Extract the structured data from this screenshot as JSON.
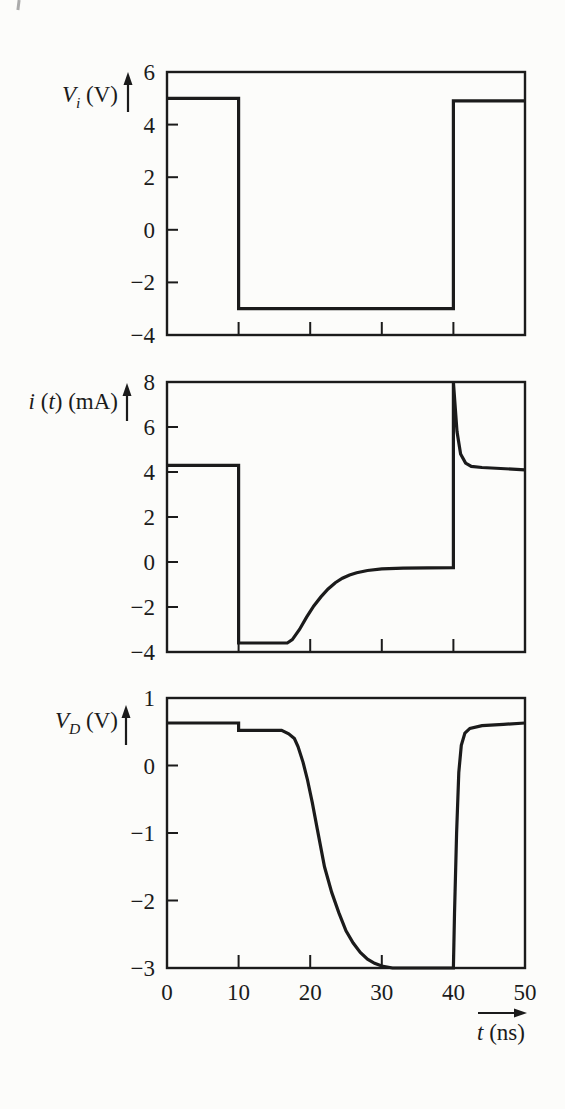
{
  "ink_color": "#1b1b1b",
  "background_color": "#fcfcfa",
  "x_axis": {
    "label": "t (ns)",
    "label_parts": [
      {
        "text": "t",
        "italic": true
      },
      {
        "text": " (ns)",
        "italic": false
      }
    ],
    "ticks": [
      0,
      10,
      20,
      30,
      40,
      50
    ],
    "range_ns": [
      0,
      50
    ]
  },
  "chart_data": [
    {
      "type": "line",
      "name": "input-voltage",
      "title": "",
      "ylabel": "Vi (V)",
      "ylabel_parts": [
        {
          "text": "V",
          "italic": true
        },
        {
          "text": "i",
          "italic": true,
          "sub": true
        },
        {
          "text": " (V)",
          "italic": false
        }
      ],
      "xlim": [
        0,
        50
      ],
      "ylim": [
        -4,
        6
      ],
      "yticks": [
        6,
        4,
        2,
        0,
        -2,
        -4
      ],
      "xticks": [
        10,
        20,
        30,
        40
      ],
      "x_tick_labels": [],
      "grid": false,
      "series": [
        {
          "name": "input-voltage",
          "points": [
            [
              0,
              5
            ],
            [
              10,
              5
            ],
            [
              10,
              -3
            ],
            [
              40,
              -3
            ],
            [
              40,
              4.9
            ],
            [
              50,
              4.9
            ]
          ]
        }
      ]
    },
    {
      "type": "line",
      "name": "diode-current",
      "title": "",
      "ylabel": "i (t) (mA)",
      "ylabel_parts": [
        {
          "text": "i",
          "italic": true
        },
        {
          "text": " (",
          "italic": false
        },
        {
          "text": "t",
          "italic": true
        },
        {
          "text": ") (mA)",
          "italic": false
        }
      ],
      "xlim": [
        0,
        50
      ],
      "ylim": [
        -4,
        8
      ],
      "yticks": [
        8,
        6,
        4,
        2,
        0,
        -2,
        -4
      ],
      "xticks": [
        10,
        20,
        30,
        40
      ],
      "x_tick_labels": [],
      "grid": false,
      "series": [
        {
          "name": "diode-current",
          "points": [
            [
              0,
              4.3
            ],
            [
              10,
              4.3
            ],
            [
              10,
              -3.6
            ],
            [
              16.8,
              -3.6
            ],
            [
              17.5,
              -3.45
            ],
            [
              18.5,
              -3.0
            ],
            [
              19.5,
              -2.45
            ],
            [
              20.5,
              -1.95
            ],
            [
              21.5,
              -1.55
            ],
            [
              22.5,
              -1.2
            ],
            [
              23.5,
              -0.92
            ],
            [
              24.5,
              -0.72
            ],
            [
              25.5,
              -0.58
            ],
            [
              26.5,
              -0.48
            ],
            [
              28,
              -0.38
            ],
            [
              30,
              -0.3
            ],
            [
              33,
              -0.27
            ],
            [
              40,
              -0.25
            ],
            [
              40,
              8
            ],
            [
              40.5,
              5.8
            ],
            [
              41,
              4.8
            ],
            [
              41.7,
              4.4
            ],
            [
              42.5,
              4.25
            ],
            [
              44,
              4.2
            ],
            [
              50,
              4.1
            ]
          ]
        }
      ]
    },
    {
      "type": "line",
      "name": "diode-voltage",
      "title": "",
      "ylabel": "VD (V)",
      "ylabel_parts": [
        {
          "text": "V",
          "italic": true
        },
        {
          "text": "D",
          "italic": true,
          "sub": true
        },
        {
          "text": " (V)",
          "italic": false
        }
      ],
      "xlabel": "t (ns)",
      "xlim": [
        0,
        50
      ],
      "ylim": [
        -3,
        1
      ],
      "yticks": [
        1,
        0,
        -1,
        -2,
        -3
      ],
      "xticks": [
        10,
        20,
        30,
        40
      ],
      "x_tick_labels": [
        0,
        10,
        20,
        30,
        40,
        50
      ],
      "grid": false,
      "series": [
        {
          "name": "diode-voltage",
          "points": [
            [
              0,
              0.63
            ],
            [
              10,
              0.63
            ],
            [
              10,
              0.52
            ],
            [
              16,
              0.52
            ],
            [
              17,
              0.47
            ],
            [
              17.8,
              0.4
            ],
            [
              18.3,
              0.28
            ],
            [
              19,
              0.05
            ],
            [
              19.6,
              -0.2
            ],
            [
              20.3,
              -0.55
            ],
            [
              21,
              -0.95
            ],
            [
              22,
              -1.5
            ],
            [
              23,
              -1.88
            ],
            [
              24,
              -2.18
            ],
            [
              25,
              -2.45
            ],
            [
              26,
              -2.63
            ],
            [
              27,
              -2.77
            ],
            [
              28,
              -2.87
            ],
            [
              29,
              -2.93
            ],
            [
              30,
              -2.97
            ],
            [
              31.5,
              -3
            ],
            [
              40,
              -3
            ],
            [
              40.15,
              -2.2
            ],
            [
              40.45,
              -1.0
            ],
            [
              40.75,
              -0.1
            ],
            [
              41.1,
              0.3
            ],
            [
              41.6,
              0.48
            ],
            [
              42.3,
              0.55
            ],
            [
              44,
              0.59
            ],
            [
              47,
              0.61
            ],
            [
              50,
              0.63
            ]
          ]
        }
      ]
    }
  ]
}
